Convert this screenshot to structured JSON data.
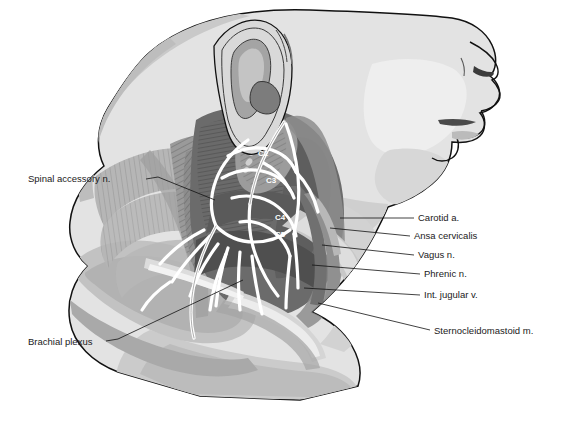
{
  "figure": {
    "background_color": "#ffffff",
    "ink_color": "#1a1a1a"
  },
  "palette": {
    "skin_light": "#e3e3e3",
    "skin_mid": "#d0d0d0",
    "skin_shadow": "#bdbdbd",
    "muscle_dark": "#6e6e6e",
    "muscle_mid": "#8a8a8a",
    "muscle_light": "#a8a8a8",
    "deep_dark": "#555555",
    "nerve_white": "#ffffff",
    "outline": "#111111"
  },
  "labels": {
    "left": [
      {
        "id": "spinal-accessory-n",
        "text": "Spinal accessory n.",
        "x": 28,
        "y": 182,
        "anchor": "start",
        "leader": [
          [
            146,
            179
          ],
          [
            158,
            177
          ],
          [
            215,
            200
          ]
        ]
      },
      {
        "id": "brachial-plexus",
        "text": "Brachial plexus",
        "x": 28,
        "y": 345,
        "anchor": "start",
        "leader": [
          [
            106,
            341
          ],
          [
            118,
            339
          ],
          [
            243,
            280
          ]
        ]
      }
    ],
    "right": [
      {
        "id": "carotid-a",
        "text": "Carotid a.",
        "x": 418,
        "y": 221,
        "anchor": "start",
        "leader": [
          [
            414,
            218
          ],
          [
            340,
            218
          ]
        ]
      },
      {
        "id": "ansa-cervicalis",
        "text": "Ansa cervicalis",
        "x": 414,
        "y": 239,
        "anchor": "start",
        "leader": [
          [
            410,
            236
          ],
          [
            330,
            228
          ]
        ]
      },
      {
        "id": "vagus-n",
        "text": "Vagus n.",
        "x": 418,
        "y": 258,
        "anchor": "start",
        "leader": [
          [
            414,
            255
          ],
          [
            322,
            245
          ]
        ]
      },
      {
        "id": "phrenic-n",
        "text": "Phrenic n.",
        "x": 424,
        "y": 277,
        "anchor": "start",
        "leader": [
          [
            420,
            274
          ],
          [
            312,
            265
          ]
        ]
      },
      {
        "id": "int-jugular-v",
        "text": "Int. jugular v.",
        "x": 424,
        "y": 298,
        "anchor": "start",
        "leader": [
          [
            420,
            295
          ],
          [
            304,
            288
          ]
        ]
      },
      {
        "id": "sternocleidomastoid-m",
        "text": "Sternocleidomastoid m.",
        "x": 434,
        "y": 334,
        "anchor": "start",
        "leader": [
          [
            430,
            330
          ],
          [
            318,
            303
          ]
        ]
      }
    ],
    "nerve_roots": [
      {
        "id": "c2",
        "text": "C2",
        "x": 258,
        "y": 156
      },
      {
        "id": "c3",
        "text": "C3",
        "x": 266,
        "y": 183
      },
      {
        "id": "c4",
        "text": "C4",
        "x": 275,
        "y": 220
      },
      {
        "id": "c5",
        "text": "C5",
        "x": 275,
        "y": 237
      }
    ]
  }
}
